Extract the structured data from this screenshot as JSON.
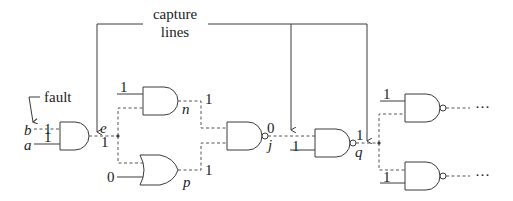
{
  "annotations": {
    "capture_line1": "capture",
    "capture_line2": "lines",
    "fault": "fault",
    "ellipsis": "···"
  },
  "nets": {
    "b": "b",
    "a": "a",
    "e": "e",
    "n": "n",
    "p": "p",
    "j": "j",
    "q": "q"
  },
  "values": {
    "b_in": "1",
    "a_in": "1",
    "e_out": "1",
    "n_side": "1",
    "p_side": "0",
    "n_out": "1",
    "p_out": "1",
    "j_out": "0",
    "q_side": "1",
    "q_out": "1",
    "r1_side": "1",
    "r2_side": "1"
  },
  "gates": [
    {
      "id": "g1",
      "type": "AND",
      "output": "e"
    },
    {
      "id": "g2",
      "type": "AND",
      "output": "n"
    },
    {
      "id": "g3",
      "type": "OR",
      "output": "p"
    },
    {
      "id": "g4",
      "type": "NAND",
      "output": "j"
    },
    {
      "id": "g5",
      "type": "NAND",
      "output": "q"
    },
    {
      "id": "g6",
      "type": "NAND",
      "output": "..."
    },
    {
      "id": "g7",
      "type": "NAND",
      "output": "..."
    }
  ]
}
